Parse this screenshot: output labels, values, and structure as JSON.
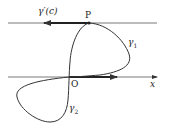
{
  "labels": {
    "tangent": "γ′(c)",
    "point_p": "P",
    "gamma1": "γ",
    "gamma1_sub": "1",
    "gamma2": "γ",
    "gamma2_sub": "2",
    "origin": "O",
    "x_axis": "x"
  },
  "colors": {
    "stroke": "#333333"
  }
}
